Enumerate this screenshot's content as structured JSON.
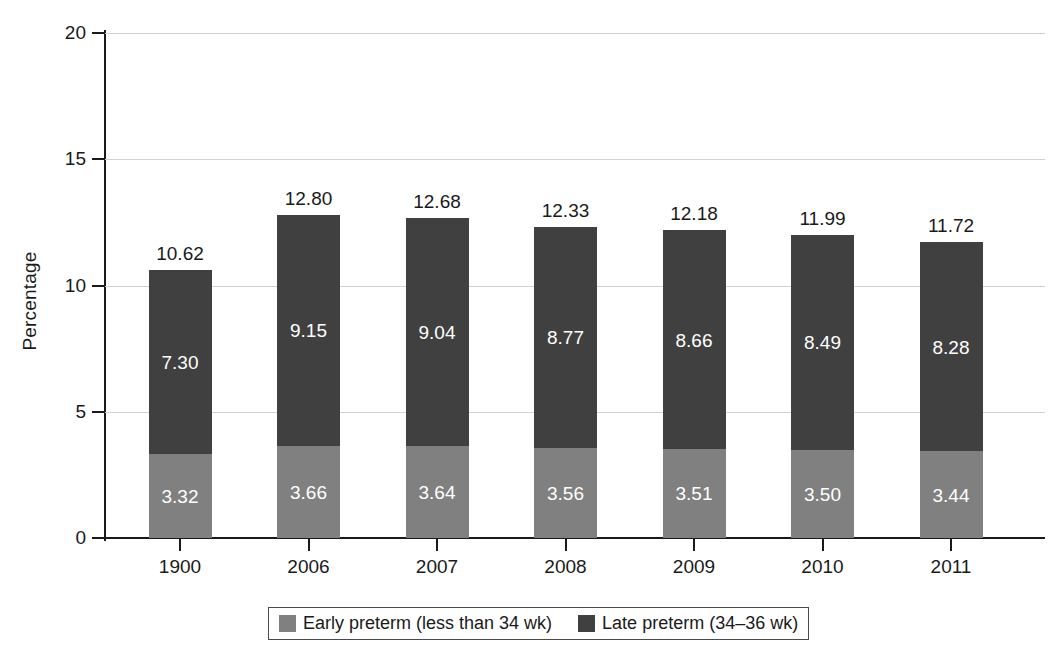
{
  "chart_data": {
    "type": "bar",
    "subtype": "stacked-bar",
    "title": "",
    "xlabel": "",
    "ylabel": "Percentage",
    "ylim": [
      0,
      20
    ],
    "yticks": [
      0,
      5,
      10,
      15,
      20
    ],
    "ytick_labels": [
      "0",
      "5",
      "10",
      "15",
      "20"
    ],
    "grid": true,
    "grid_axis": "y",
    "legend_position": "bottom",
    "categories": [
      "1900",
      "2006",
      "2007",
      "2008",
      "2009",
      "2010",
      "2011"
    ],
    "series": [
      {
        "name": "Early preterm (less than 34 wk)",
        "color": "#808080",
        "values": [
          3.32,
          3.66,
          3.64,
          3.56,
          3.51,
          3.5,
          3.44
        ],
        "labels": [
          "3.32",
          "3.66",
          "3.64",
          "3.56",
          "3.51",
          "3.50",
          "3.44"
        ]
      },
      {
        "name": "Late preterm (34–36 wk)",
        "color": "#404040",
        "values": [
          7.3,
          9.15,
          9.04,
          8.77,
          8.66,
          8.49,
          8.28
        ],
        "labels": [
          "7.30",
          "9.15",
          "9.04",
          "8.77",
          "8.66",
          "8.49",
          "8.28"
        ]
      }
    ],
    "totals": [
      10.62,
      12.8,
      12.68,
      12.33,
      12.18,
      11.99,
      11.72
    ],
    "total_labels": [
      "10.62",
      "12.80",
      "12.68",
      "12.33",
      "12.18",
      "11.99",
      "11.72"
    ]
  },
  "axes": {
    "y_title": "Percentage",
    "y_ticks": [
      {
        "value": 20,
        "label": "20"
      },
      {
        "value": 15,
        "label": "15"
      },
      {
        "value": 10,
        "label": "10"
      },
      {
        "value": 5,
        "label": "5"
      },
      {
        "value": 0,
        "label": "0"
      }
    ],
    "x_ticks": [
      {
        "label": "1900"
      },
      {
        "label": "2006"
      },
      {
        "label": "2007"
      },
      {
        "label": "2008"
      },
      {
        "label": "2009"
      },
      {
        "label": "2010"
      },
      {
        "label": "2011"
      }
    ]
  },
  "legend": {
    "items": [
      {
        "label": "Early preterm (less than 34 wk)",
        "color": "#808080"
      },
      {
        "label": "Late preterm (34–36 wk)",
        "color": "#404040"
      }
    ]
  },
  "colors": {
    "early_preterm": "#808080",
    "late_preterm": "#404040",
    "axis": "#1a1a1a",
    "gridline": "#d2d2d2",
    "background": "#ffffff",
    "value_label_on_bar": "#ffffff"
  }
}
